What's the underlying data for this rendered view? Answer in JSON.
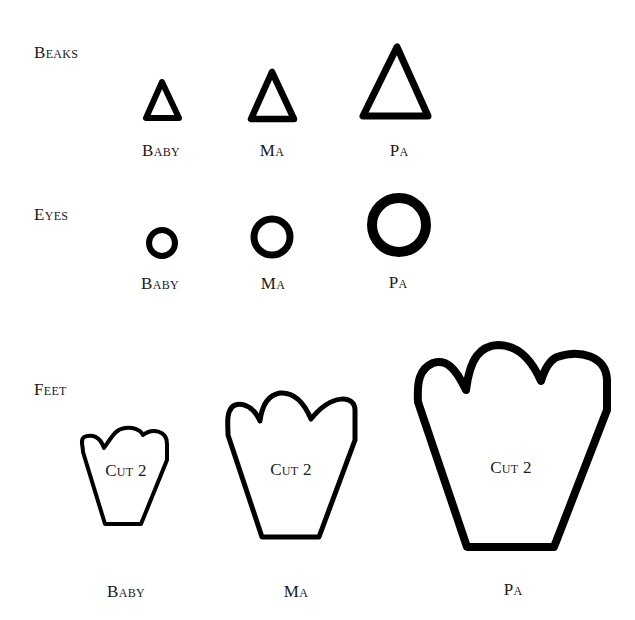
{
  "sections": {
    "beaks": {
      "title": "Beaks",
      "items": [
        {
          "label": "Baby",
          "shape": "triangle-outline"
        },
        {
          "label": "Ma",
          "shape": "triangle-outline"
        },
        {
          "label": "Pa",
          "shape": "triangle-outline"
        }
      ]
    },
    "eyes": {
      "title": "Eyes",
      "items": [
        {
          "label": "Baby",
          "shape": "circle-outline"
        },
        {
          "label": "Ma",
          "shape": "circle-outline"
        },
        {
          "label": "Pa",
          "shape": "circle-outline"
        }
      ]
    },
    "feet": {
      "title": "Feet",
      "items": [
        {
          "label": "Baby",
          "shape": "foot-outline",
          "instruction": "Cut 2"
        },
        {
          "label": "Ma",
          "shape": "foot-outline",
          "instruction": "Cut 2"
        },
        {
          "label": "Pa",
          "shape": "foot-outline",
          "instruction": "Cut 2"
        }
      ]
    }
  },
  "colors": {
    "stroke": "#000000",
    "background": "#ffffff",
    "text": "#1a1a1a"
  }
}
